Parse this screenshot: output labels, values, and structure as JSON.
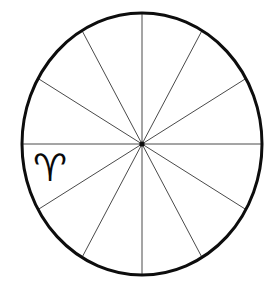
{
  "figure": {
    "background_color": "#ffffff",
    "width": 277,
    "height": 284
  },
  "wheel": {
    "center_x": 142,
    "center_y": 144,
    "radius_x": 120,
    "radius_y": 131,
    "rim_color": "#0d0d0d",
    "rim_stroke_width": 3,
    "spoke_color": "#4a4a4a",
    "spoke_stroke_width": 1,
    "sector_count": 12,
    "sector_degrees": 30,
    "spoke_count": 6,
    "spoke_angles_deg": [
      0,
      30,
      60,
      90,
      120,
      150,
      180,
      210,
      240,
      270,
      300,
      330
    ]
  },
  "labels": {
    "aries": {
      "glyph": "♈",
      "name": "aries-glyph",
      "sector_start_deg": 180,
      "sector_end_deg": 210
    }
  },
  "chart_data": {
    "type": "pie",
    "categories": [
      "1",
      "2",
      "3",
      "4",
      "5",
      "6",
      "7",
      "8",
      "9",
      "10",
      "11",
      "12"
    ],
    "values": [
      30,
      30,
      30,
      30,
      30,
      30,
      30,
      30,
      30,
      30,
      30,
      30
    ],
    "xlabel": "",
    "ylabel": "",
    "legend": [],
    "annotations": [
      "♈"
    ],
    "grid": false
  }
}
